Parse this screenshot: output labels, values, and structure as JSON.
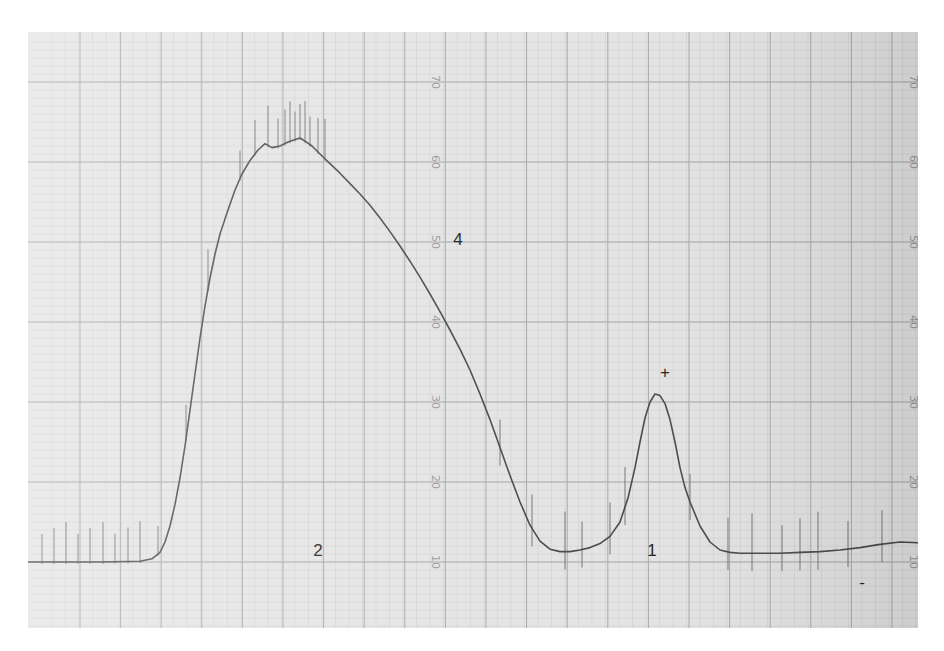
{
  "chart_data": {
    "type": "line",
    "title": "",
    "xlabel": "",
    "ylabel": "",
    "ylim": [
      5,
      75
    ],
    "grid": true,
    "scale_ticks": [
      10,
      20,
      30,
      40,
      50,
      60,
      70
    ],
    "scale_tick_labels": [
      "10",
      "20",
      "30",
      "40",
      "50",
      "60",
      "70"
    ],
    "scale_columns_x": [
      432,
      910
    ],
    "annotations": [
      {
        "text": "2",
        "x": 318,
        "y_px": 550,
        "note": "label under large peak"
      },
      {
        "text": "1",
        "x": 652,
        "y_px": 550,
        "note": "label under small peak"
      },
      {
        "text": "+",
        "x": 665,
        "y_px": 378,
        "note": "pen mark above peak 1"
      },
      {
        "text": "4",
        "x": 458,
        "y_px": 245,
        "note": "faint handwritten mark"
      },
      {
        "text": "-",
        "x": 862,
        "y_px": 588,
        "note": "pen dash near right baseline"
      }
    ],
    "peaks": [
      {
        "label": "2",
        "x_px": 300,
        "value": 63
      },
      {
        "label": "1",
        "x_px": 658,
        "value": 31
      }
    ],
    "series": [
      {
        "name": "trace",
        "x_px": [
          28,
          60,
          100,
          140,
          152,
          160,
          165,
          170,
          175,
          180,
          185,
          190,
          195,
          200,
          205,
          210,
          215,
          220,
          228,
          235,
          242,
          250,
          258,
          265,
          272,
          280,
          288,
          295,
          300,
          305,
          312,
          320,
          330,
          340,
          350,
          360,
          370,
          380,
          390,
          400,
          410,
          420,
          430,
          440,
          450,
          460,
          470,
          480,
          490,
          500,
          510,
          520,
          530,
          540,
          550,
          560,
          570,
          580,
          590,
          600,
          610,
          620,
          628,
          635,
          640,
          645,
          650,
          655,
          660,
          665,
          670,
          675,
          680,
          685,
          690,
          695,
          700,
          710,
          720,
          730,
          740,
          760,
          780,
          800,
          820,
          840,
          860,
          880,
          900,
          918
        ],
        "values": [
          10.0,
          10.0,
          10.0,
          10.1,
          10.4,
          11.2,
          12.5,
          14.5,
          17.2,
          20.5,
          24.5,
          29.0,
          33.5,
          38.0,
          42.0,
          45.5,
          48.5,
          51.0,
          54.0,
          56.5,
          58.5,
          60.2,
          61.5,
          62.3,
          61.8,
          62.0,
          62.5,
          62.8,
          63.0,
          62.6,
          62.0,
          61.0,
          59.8,
          58.6,
          57.3,
          56.0,
          54.6,
          53.0,
          51.3,
          49.5,
          47.6,
          45.6,
          43.5,
          41.3,
          39.0,
          36.6,
          34.0,
          31.0,
          27.8,
          24.3,
          20.8,
          17.5,
          14.6,
          12.6,
          11.6,
          11.3,
          11.3,
          11.5,
          11.8,
          12.3,
          13.2,
          15.0,
          18.0,
          21.8,
          25.0,
          28.0,
          30.0,
          31.0,
          30.8,
          29.8,
          27.8,
          25.0,
          21.8,
          19.3,
          17.5,
          16.0,
          14.5,
          12.5,
          11.5,
          11.2,
          11.1,
          11.1,
          11.1,
          11.2,
          11.3,
          11.5,
          11.8,
          12.2,
          12.5,
          12.4
        ]
      }
    ],
    "event_ticks_x_px": [
      42,
      54,
      66,
      78,
      90,
      103,
      115,
      128,
      140,
      158,
      186,
      208,
      240,
      255,
      268,
      278,
      285,
      290,
      295,
      300,
      305,
      310,
      318,
      325,
      500,
      532,
      565,
      582,
      610,
      625,
      690,
      728,
      752,
      782,
      800,
      818,
      848,
      882
    ]
  },
  "style": {
    "paper_color": "#e4e4e4",
    "grid_minor_color": "#d0d0d0",
    "grid_major_color": "#a8a8a8",
    "trace_color": "#4a4a4a",
    "background": "#ffffff"
  }
}
